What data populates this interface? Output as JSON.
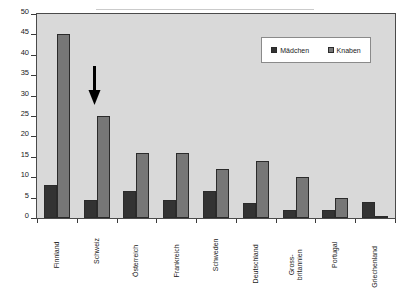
{
  "chart_data": {
    "type": "bar",
    "title": "",
    "xlabel": "",
    "ylabel": "",
    "ylim": [
      0,
      50
    ],
    "yticks": [
      0,
      5,
      10,
      15,
      20,
      25,
      30,
      35,
      40,
      45,
      50
    ],
    "grid": false,
    "legend_position": "top-right",
    "categories": [
      "Finnland",
      "Schweiz",
      "Österreich",
      "Frankreich",
      "Schweden",
      "Deutschland",
      "Gross-\nbritannien",
      "Portugal",
      "Griechenland"
    ],
    "series": [
      {
        "name": "Mädchen",
        "color": "#333333",
        "values": [
          8,
          4.5,
          6.5,
          4.3,
          6.5,
          3.7,
          2,
          2,
          4
        ]
      },
      {
        "name": "Knaben",
        "color": "#777777",
        "values": [
          45,
          25,
          16,
          16,
          12,
          14,
          10,
          4.8,
          0.5
        ]
      }
    ],
    "annotations": [
      {
        "name": "arrow-down",
        "glyph": "↓",
        "target_category": "Schweiz",
        "target_series": "Knaben",
        "color": "#000000"
      }
    ]
  },
  "legend": {
    "items": [
      {
        "label": "Mädchen",
        "color": "#333333"
      },
      {
        "label": "Knaben",
        "color": "#777777"
      }
    ]
  },
  "colors": {
    "plot_background": "#d9d9d9",
    "plot_border": "#4a4a4a",
    "page_background": "#ffffff",
    "axis": "#3a3a3a",
    "text": "#1a1a1a",
    "girls": "#333333",
    "boys": "#777777"
  }
}
